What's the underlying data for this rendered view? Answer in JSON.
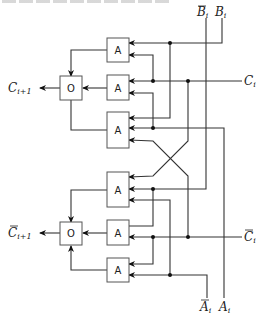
{
  "figure": {
    "header_text_truncated": "",
    "labels": {
      "b_bar": "B",
      "b_bar_sub": "i",
      "b": "B",
      "b_sub": "i",
      "c": "C",
      "c_sub": "i",
      "c_bar": "C",
      "c_bar_sub": "i",
      "a_bar": "A",
      "a_bar_sub": "i",
      "a": "A",
      "a_sub": "i",
      "c_out": "C",
      "c_out_sub": "i+1",
      "c_bar_out": "C",
      "c_bar_out_sub": "i+1"
    },
    "gates": {
      "top_and_1": "A",
      "top_and_2": "A",
      "top_and_3": "A",
      "top_or": "O",
      "bottom_and_1": "A",
      "bottom_and_2": "A",
      "bottom_and_3": "A",
      "bottom_or": "O"
    }
  }
}
